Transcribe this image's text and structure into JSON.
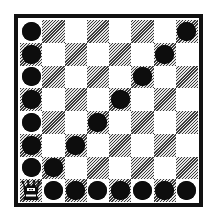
{
  "game": {
    "type": "checkers",
    "rows": 8,
    "cols": 8,
    "dark_square_rule": "row+col odd",
    "colors": {
      "frame": "#111111",
      "light_square": "#ffffff",
      "dark_square_hatch": "#3a3a3a",
      "piece": "#0d0d0d"
    }
  },
  "board": {
    "rows": [
      [
        "piece",
        "",
        "",
        "",
        "",
        "",
        "",
        "piece"
      ],
      [
        "piece",
        "",
        "",
        "",
        "",
        "",
        "piece",
        ""
      ],
      [
        "piece",
        "",
        "",
        "",
        "",
        "piece",
        "",
        ""
      ],
      [
        "piece",
        "",
        "",
        "",
        "piece",
        "",
        "",
        ""
      ],
      [
        "piece",
        "",
        "",
        "piece",
        "",
        "",
        "",
        ""
      ],
      [
        "piece",
        "",
        "piece",
        "",
        "",
        "",
        "",
        ""
      ],
      [
        "piece",
        "piece",
        "",
        "",
        "",
        "",
        "",
        ""
      ],
      [
        "king",
        "piece",
        "piece",
        "piece",
        "piece",
        "piece",
        "piece",
        "piece"
      ]
    ]
  },
  "icons": {
    "piece": "black-checker-piece",
    "king": "crown-king-icon"
  }
}
